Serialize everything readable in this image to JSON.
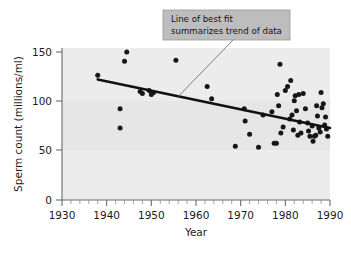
{
  "chart_data": {
    "type": "scatter",
    "title": "",
    "xlabel": "Year",
    "ylabel": "Sperm count (millions/ml)",
    "xlim": [
      1930,
      1990
    ],
    "ylim": [
      0,
      150
    ],
    "xticks": [
      1930,
      1940,
      1950,
      1960,
      1970,
      1980,
      1990
    ],
    "xtick_labels": [
      "1930",
      "1940",
      "1950",
      "1960",
      "1970",
      "1980",
      "1990"
    ],
    "xminor_step": 2,
    "yticks": [
      0,
      50,
      100,
      150
    ],
    "ytick_labels": [
      "0",
      "50",
      "100",
      "150"
    ],
    "grid": false,
    "legend": null,
    "point_color": "#171717",
    "fit_line_color": "#111111",
    "plot_background": "#e6e6e6",
    "series": [
      {
        "name": "Sperm count observations",
        "points": [
          [
            1938,
            123
          ],
          [
            1943,
            90
          ],
          [
            1943,
            71
          ],
          [
            1944,
            137
          ],
          [
            1944.5,
            146
          ],
          [
            1947.5,
            107
          ],
          [
            1948,
            105
          ],
          [
            1949.5,
            108
          ],
          [
            1950,
            104
          ],
          [
            1950.5,
            106
          ],
          [
            1955.5,
            138
          ],
          [
            1962.5,
            112
          ],
          [
            1963.5,
            100
          ],
          [
            1968.8,
            53
          ],
          [
            1970.8,
            90
          ],
          [
            1971,
            78
          ],
          [
            1972,
            65
          ],
          [
            1974,
            52
          ],
          [
            1975,
            84
          ],
          [
            1977,
            87
          ],
          [
            1977.5,
            56
          ],
          [
            1978,
            56
          ],
          [
            1978.2,
            104
          ],
          [
            1978.5,
            93
          ],
          [
            1978.8,
            134
          ],
          [
            1979,
            66
          ],
          [
            1979.5,
            72
          ],
          [
            1980,
            108
          ],
          [
            1980.5,
            112
          ],
          [
            1981,
            80
          ],
          [
            1981.2,
            118
          ],
          [
            1981.5,
            84
          ],
          [
            1981.8,
            69
          ],
          [
            1982,
            98
          ],
          [
            1982.2,
            103
          ],
          [
            1982.5,
            88
          ],
          [
            1982.8,
            64
          ],
          [
            1983,
            104
          ],
          [
            1983.2,
            77
          ],
          [
            1983.5,
            66
          ],
          [
            1984,
            105
          ],
          [
            1984.5,
            90
          ],
          [
            1985,
            76
          ],
          [
            1985.2,
            68
          ],
          [
            1985.5,
            63
          ],
          [
            1986,
            73
          ],
          [
            1986.2,
            58
          ],
          [
            1986.5,
            63
          ],
          [
            1986.8,
            64
          ],
          [
            1987,
            93
          ],
          [
            1987.2,
            83
          ],
          [
            1987.5,
            71
          ],
          [
            1987.8,
            67
          ],
          [
            1988,
            106
          ],
          [
            1988.2,
            91
          ],
          [
            1988.5,
            95
          ],
          [
            1988.8,
            74
          ],
          [
            1989,
            82
          ],
          [
            1989.2,
            70
          ],
          [
            1989.5,
            63
          ]
        ]
      }
    ],
    "fit_line": {
      "name": "Line of best fit",
      "start": [
        1938,
        119
      ],
      "end": [
        1990,
        71
      ]
    },
    "annotations": [
      {
        "name": "line-of-best-fit-callout",
        "line1": "Line of best fit",
        "line2": "summarizes trend of data",
        "target": [
          1956,
          102
        ]
      }
    ]
  }
}
